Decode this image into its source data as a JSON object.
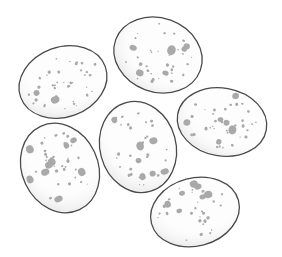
{
  "image": {
    "subject": "Six speckled eggs",
    "description": "Line drawing of six white eggs with gray speckles arranged in a loose cluster",
    "colors": {
      "background": "#ffffff",
      "outline": "#4a4a4a",
      "shell": "#fdfdfd",
      "speckle": "#a9a9a9"
    },
    "egg_count": 6
  }
}
